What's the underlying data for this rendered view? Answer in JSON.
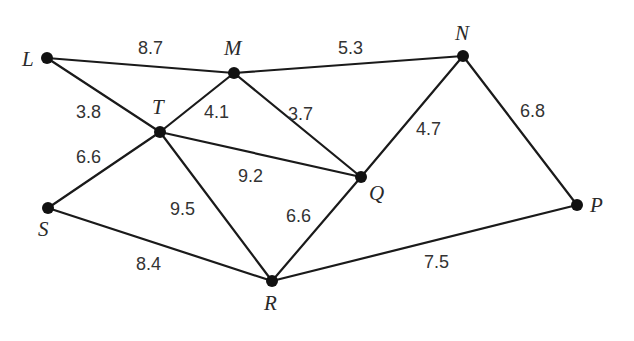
{
  "nodes": [
    {
      "id": "L",
      "label": "L"
    },
    {
      "id": "M",
      "label": "M"
    },
    {
      "id": "N",
      "label": "N"
    },
    {
      "id": "T",
      "label": "T"
    },
    {
      "id": "Q",
      "label": "Q"
    },
    {
      "id": "S",
      "label": "S"
    },
    {
      "id": "R",
      "label": "R"
    },
    {
      "id": "P",
      "label": "P"
    }
  ],
  "edges": [
    {
      "from": "L",
      "to": "M",
      "weight": "8.7"
    },
    {
      "from": "M",
      "to": "N",
      "weight": "5.3"
    },
    {
      "from": "L",
      "to": "T",
      "weight": "3.8"
    },
    {
      "from": "T",
      "to": "M",
      "weight": "4.1"
    },
    {
      "from": "M",
      "to": "Q",
      "weight": "3.7"
    },
    {
      "from": "N",
      "to": "Q",
      "weight": "4.7"
    },
    {
      "from": "N",
      "to": "P",
      "weight": "6.8"
    },
    {
      "from": "S",
      "to": "T",
      "weight": "6.6"
    },
    {
      "from": "T",
      "to": "Q",
      "weight": "9.2"
    },
    {
      "from": "T",
      "to": "R",
      "weight": "9.5"
    },
    {
      "from": "R",
      "to": "Q",
      "weight": "6.6"
    },
    {
      "from": "S",
      "to": "R",
      "weight": "8.4"
    },
    {
      "from": "R",
      "to": "P",
      "weight": "7.5"
    }
  ]
}
